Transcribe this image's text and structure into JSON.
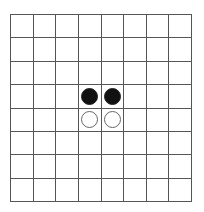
{
  "board": {
    "rows": 8,
    "cols": 8,
    "line_color": "#555555",
    "background": "#ffffff",
    "pieces": [
      {
        "row": 3,
        "col": 3,
        "color": "black"
      },
      {
        "row": 3,
        "col": 4,
        "color": "black"
      },
      {
        "row": 4,
        "col": 3,
        "color": "white"
      },
      {
        "row": 4,
        "col": 4,
        "color": "white"
      }
    ]
  }
}
